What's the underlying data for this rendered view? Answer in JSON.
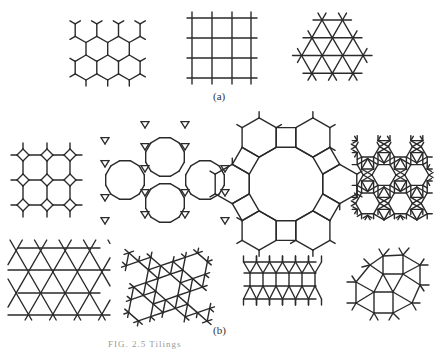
{
  "figure": {
    "part_a_label": "(a)",
    "part_b_label": "(b)",
    "caption_partial": "FIG. 2.5  Tilings"
  },
  "part_a": {
    "panels": [
      {
        "name": "honeycomb-lattice",
        "description": "Regular hexagonal tiling (6.6.6)"
      },
      {
        "name": "square-lattice",
        "description": "Regular square tiling (4.4.4.4)"
      },
      {
        "name": "triangular-lattice",
        "description": "Regular triangular tiling (3.3.3.3.3.3)"
      }
    ]
  },
  "part_b": {
    "panels": [
      {
        "name": "truncated-square-tiling",
        "description": "Octagons and squares (4.8.8)"
      },
      {
        "name": "truncated-hexagonal-tiling",
        "description": "Dodecagons and triangles (3.12.12)"
      },
      {
        "name": "truncated-trihexagonal-tiling",
        "description": "Dodecagons, hexagons and squares (4.6.12)"
      },
      {
        "name": "rhombitrihexagonal-tiling",
        "description": "Hexagons, squares and triangles (3.4.6.4)"
      },
      {
        "name": "kagome-tiling",
        "description": "Trihexagonal tiling (3.6.3.6)"
      },
      {
        "name": "snub-hexagonal-tiling",
        "description": "Hexagons and triangles (3.3.3.3.6)"
      },
      {
        "name": "elongated-triangular-tiling",
        "description": "Squares and triangles (3.3.3.4.4)"
      },
      {
        "name": "snub-square-tiling",
        "description": "Squares and triangles (3.3.4.3.4)"
      }
    ]
  },
  "colors": {
    "line": "#2a2a2a",
    "background": "#ffffff"
  }
}
